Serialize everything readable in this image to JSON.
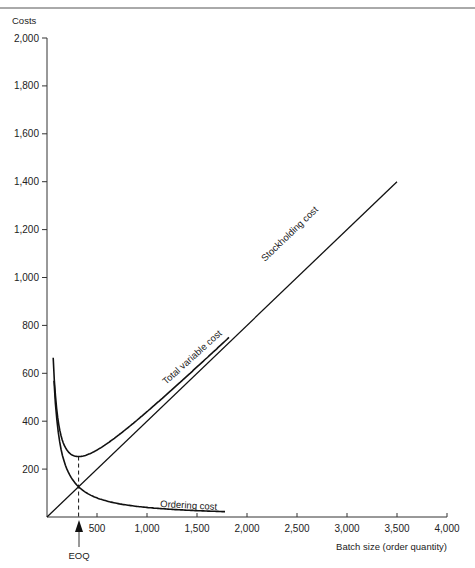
{
  "chart_data": {
    "type": "line",
    "title": "",
    "xlabel": "Batch size (order quantity)",
    "ylabel": "Costs",
    "xlim": [
      0,
      4000
    ],
    "ylim": [
      0,
      2000
    ],
    "grid": false,
    "legend": "none (curves labelled inline)",
    "x_ticks": [
      500,
      1000,
      1500,
      2000,
      2500,
      3000,
      3500,
      4000
    ],
    "x_tick_labels": [
      "500",
      "1,000",
      "1,500",
      "2,000",
      "2,500",
      "3,000",
      "3,500",
      "4,000"
    ],
    "y_ticks": [
      200,
      400,
      600,
      800,
      1000,
      1200,
      1400,
      1600,
      1800,
      2000
    ],
    "y_tick_labels": [
      "200",
      "400",
      "600",
      "800",
      "1,000",
      "1,200",
      "1,400",
      "1,600",
      "1,800",
      "2,000"
    ],
    "series": [
      {
        "name": "Stockholding cost",
        "label": "Stockholding cost",
        "formula": "0.4 * Q",
        "x": [
          0,
          500,
          1000,
          1500,
          2000,
          2500,
          3000,
          3500
        ],
        "values": [
          0,
          200,
          400,
          600,
          800,
          1000,
          1200,
          1400
        ]
      },
      {
        "name": "Ordering cost",
        "label": "Ordering cost",
        "formula": "40000 / Q",
        "x": [
          70,
          100,
          150,
          200,
          316,
          500,
          750,
          1000,
          1250,
          1500,
          1780
        ],
        "values": [
          571,
          400,
          267,
          200,
          126,
          80,
          53,
          40,
          32,
          27,
          22
        ]
      },
      {
        "name": "Total variable cost",
        "label": "Total variable cost",
        "formula": "0.4 * Q + 40000 / Q",
        "x": [
          40,
          60,
          100,
          150,
          200,
          316,
          500,
          750,
          1000,
          1250,
          1500,
          1820
        ],
        "values": [
          1016,
          691,
          440,
          327,
          280,
          253,
          280,
          353,
          440,
          532,
          627,
          750
        ]
      }
    ],
    "annotations": [
      {
        "text": "EOQ",
        "x": 316,
        "description": "Arrow pointing up to the x-axis at the economic order quantity; dashed vertical line from minimum of total variable cost down through the crossing of stockholding and ordering cost."
      }
    ]
  },
  "labels": {
    "y_axis_title": "Costs",
    "x_axis_title": "Batch size (order quantity)",
    "stockholding": "Stockholding cost",
    "total_variable": "Total variable cost",
    "ordering": "Ordering cost",
    "eoq": "EOQ"
  }
}
